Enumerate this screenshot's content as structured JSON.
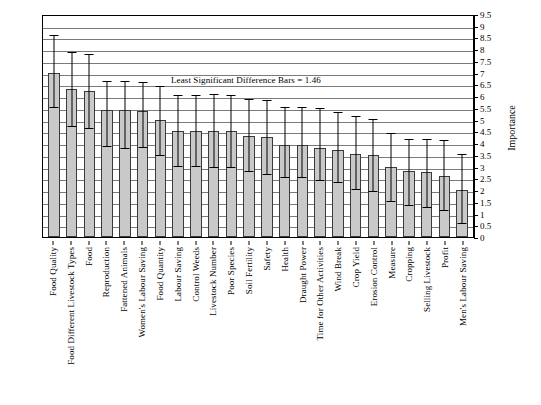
{
  "chart_data": {
    "type": "bar",
    "title": "",
    "annotation": "Least Significant Difference Bars = 1.46",
    "xlabel": "",
    "ylabel": "Importance",
    "ylim": [
      0,
      9.5
    ],
    "ytick_step": 0.5,
    "grid": true,
    "legend": "none",
    "error_bar_half_width": 0.73,
    "error_bar_type": "Least Significant Difference (LSD)",
    "lsd_value": 1.46,
    "yticks": [
      "0",
      "0.5",
      "1",
      "1.5",
      "2",
      "2.5",
      "3",
      "3.5",
      "4",
      "4.5",
      "5",
      "5.5",
      "6",
      "6.5",
      "7",
      "7.5",
      "8",
      "8.5",
      "9",
      "9.5"
    ],
    "categories": [
      "Food Quality",
      "Food Different Livestock Types",
      "Food",
      "Reproduction",
      "Fattened Animals",
      "Women's Labour Saving",
      "Food Quantity",
      "Labour Saving",
      "Control Weeds",
      "Livestock Number",
      "Poor Species",
      "Soil Fertility",
      "Safety",
      "Health",
      "Draught Power",
      "Time for Other Activities",
      "Wind Break",
      "Crop Yield",
      "Erosion Control",
      "Measure",
      "Cropping",
      "Selling Livestock",
      "Profit",
      "Men's Labour Saving"
    ],
    "values": [
      7.0,
      6.3,
      6.2,
      5.4,
      5.4,
      5.35,
      5.0,
      4.5,
      4.5,
      4.5,
      4.5,
      4.3,
      4.25,
      3.9,
      3.9,
      3.8,
      3.7,
      3.55,
      3.5,
      3.0,
      2.8,
      2.75,
      2.6,
      2.0
    ],
    "errors_upper": [
      8.55,
      7.85,
      7.75,
      6.6,
      6.6,
      6.55,
      6.4,
      6.0,
      6.0,
      6.05,
      6.0,
      5.85,
      5.8,
      5.5,
      5.5,
      5.45,
      5.3,
      5.1,
      5.0,
      4.4,
      4.15,
      4.15,
      4.1,
      3.5
    ],
    "errors_lower": [
      5.5,
      4.7,
      4.6,
      3.85,
      3.75,
      3.8,
      3.45,
      3.0,
      3.0,
      2.95,
      2.95,
      2.75,
      2.65,
      2.5,
      2.5,
      2.4,
      2.3,
      2.0,
      1.9,
      1.5,
      1.3,
      1.25,
      1.1,
      0.55
    ]
  },
  "colors": {
    "bar_fill": "#c9c9c9",
    "bar_stroke": "#3a3a3a",
    "gridline": "#7a7a7a",
    "axis": "#000000",
    "error_bar": "#000000",
    "background": "#ffffff"
  }
}
